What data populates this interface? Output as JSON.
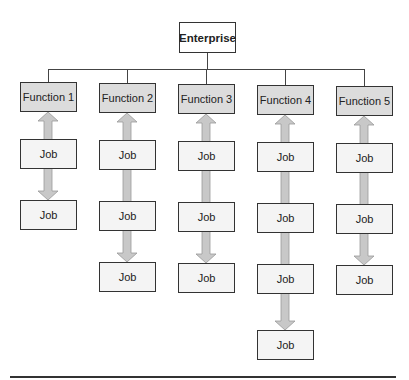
{
  "diagram": {
    "root": {
      "label": "Enterprise"
    },
    "functions": [
      {
        "label": "Function 1",
        "jobs": [
          "Job",
          "Job"
        ]
      },
      {
        "label": "Function 2",
        "jobs": [
          "Job",
          "Job",
          "Job"
        ]
      },
      {
        "label": "Function 3",
        "jobs": [
          "Job",
          "Job",
          "Job"
        ]
      },
      {
        "label": "Function 4",
        "jobs": [
          "Job",
          "Job",
          "Job",
          "Job"
        ]
      },
      {
        "label": "Function 5",
        "jobs": [
          "Job",
          "Job",
          "Job"
        ]
      }
    ]
  },
  "colors": {
    "function_fill": "#dcdcdc",
    "job_fill": "#f4f4f4",
    "arrow_fill": "#c8c8c8",
    "border": "#333333"
  }
}
